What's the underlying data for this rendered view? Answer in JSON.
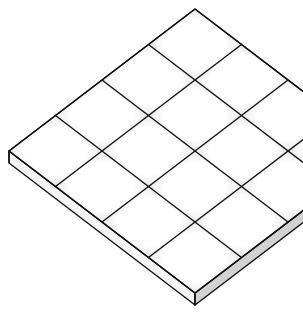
{
  "figure": {
    "kind": "isometric-tile-slab",
    "grid": {
      "rows": 4,
      "cols": 4
    },
    "geometry": {
      "top_vertex": [
        195,
        9
      ],
      "cell_down_left": [
        -46.5,
        35.5
      ],
      "cell_down_right": [
        46.5,
        35.5
      ],
      "slab_thickness": 12
    },
    "colors": {
      "background": "#ffffff",
      "line": "#111111",
      "tile_center": "#ffffff",
      "tile_edge": "#dcdcdc",
      "slab_left_face": "#f4f4f4",
      "slab_right_face": "#d2d2d2"
    },
    "stroke_width": 1.4
  }
}
